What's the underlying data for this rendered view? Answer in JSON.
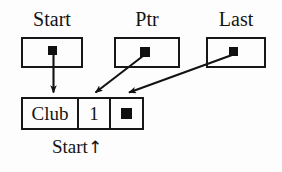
{
  "diagram": {
    "ink_color": "#171717",
    "background_color": "#fdfdfd",
    "pointer_variables": [
      {
        "label": "Start",
        "box_name": "start-box",
        "dot_name": "start-pointer-dot"
      },
      {
        "label": "Ptr",
        "box_name": "ptr-box",
        "dot_name": "ptr-pointer-dot"
      },
      {
        "label": "Last",
        "box_name": "last-box",
        "dot_name": "last-pointer-dot"
      }
    ],
    "node": {
      "data_value": "Club",
      "key_value": "1",
      "next_pointer_glyph": "nil-dot"
    },
    "node_caption": {
      "text": "Start",
      "arrow": "↑"
    },
    "arrows": [
      {
        "name": "start-to-node-arrow",
        "from": "start-pointer-dot",
        "to": "node-data-cell"
      },
      {
        "name": "ptr-to-node-arrow",
        "from": "ptr-pointer-dot",
        "to": "node-top"
      },
      {
        "name": "last-to-node-arrow",
        "from": "last-pointer-dot",
        "to": "node-top"
      }
    ]
  }
}
